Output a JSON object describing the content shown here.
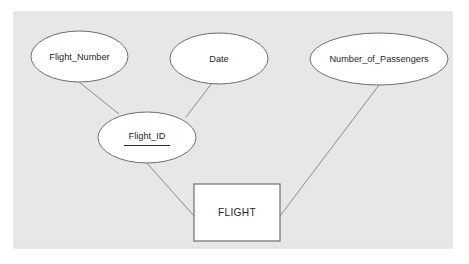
{
  "diagram": {
    "kind": "er-diagram",
    "canvas": {
      "page_background": "#ffffff",
      "board_background": "#e7e7e7",
      "board_border": "#dcdcdc",
      "stroke_color": "#808080",
      "shape_fill": "#ffffff",
      "text_color": "#262626"
    },
    "entities": [
      {
        "id": "flight",
        "shape": "rectangle",
        "label": "FLIGHT",
        "x": 194,
        "y": 184,
        "width": 86,
        "height": 57
      }
    ],
    "attributes": [
      {
        "id": "flight_number",
        "shape": "ellipse",
        "label": "Flight_Number",
        "is_key": false,
        "cx": 79.5,
        "cy": 56.5,
        "rx": 48.5,
        "ry": 25.5
      },
      {
        "id": "date",
        "shape": "ellipse",
        "label": "Date",
        "is_key": false,
        "cx": 219,
        "cy": 58.5,
        "rx": 49,
        "ry": 25.5
      },
      {
        "id": "number_of_passengers",
        "shape": "ellipse",
        "label": "Number_of_Passengers",
        "is_key": false,
        "cx": 379,
        "cy": 59,
        "rx": 69,
        "ry": 26
      },
      {
        "id": "flight_id",
        "shape": "ellipse",
        "label": "Flight_ID",
        "is_key": true,
        "cx": 147,
        "cy": 137.5,
        "rx": 49,
        "ry": 25.5
      }
    ],
    "connectors": [
      {
        "id": "flight_number-to-flight_id",
        "from": "flight_number",
        "to": "flight_id",
        "x1": 79,
        "y1": 82,
        "x2": 119,
        "y2": 114
      },
      {
        "id": "date-to-flight_id",
        "from": "date",
        "to": "flight_id",
        "x1": 212,
        "y1": 83,
        "x2": 186,
        "y2": 117
      },
      {
        "id": "flight_id-to-flight",
        "from": "flight_id",
        "to": "flight",
        "x1": 146,
        "y1": 162,
        "x2": 194,
        "y2": 216
      },
      {
        "id": "number_of_passengers-to-flight",
        "from": "number_of_passengers",
        "to": "flight",
        "x1": 379,
        "y1": 85,
        "x2": 280,
        "y2": 216
      }
    ]
  }
}
